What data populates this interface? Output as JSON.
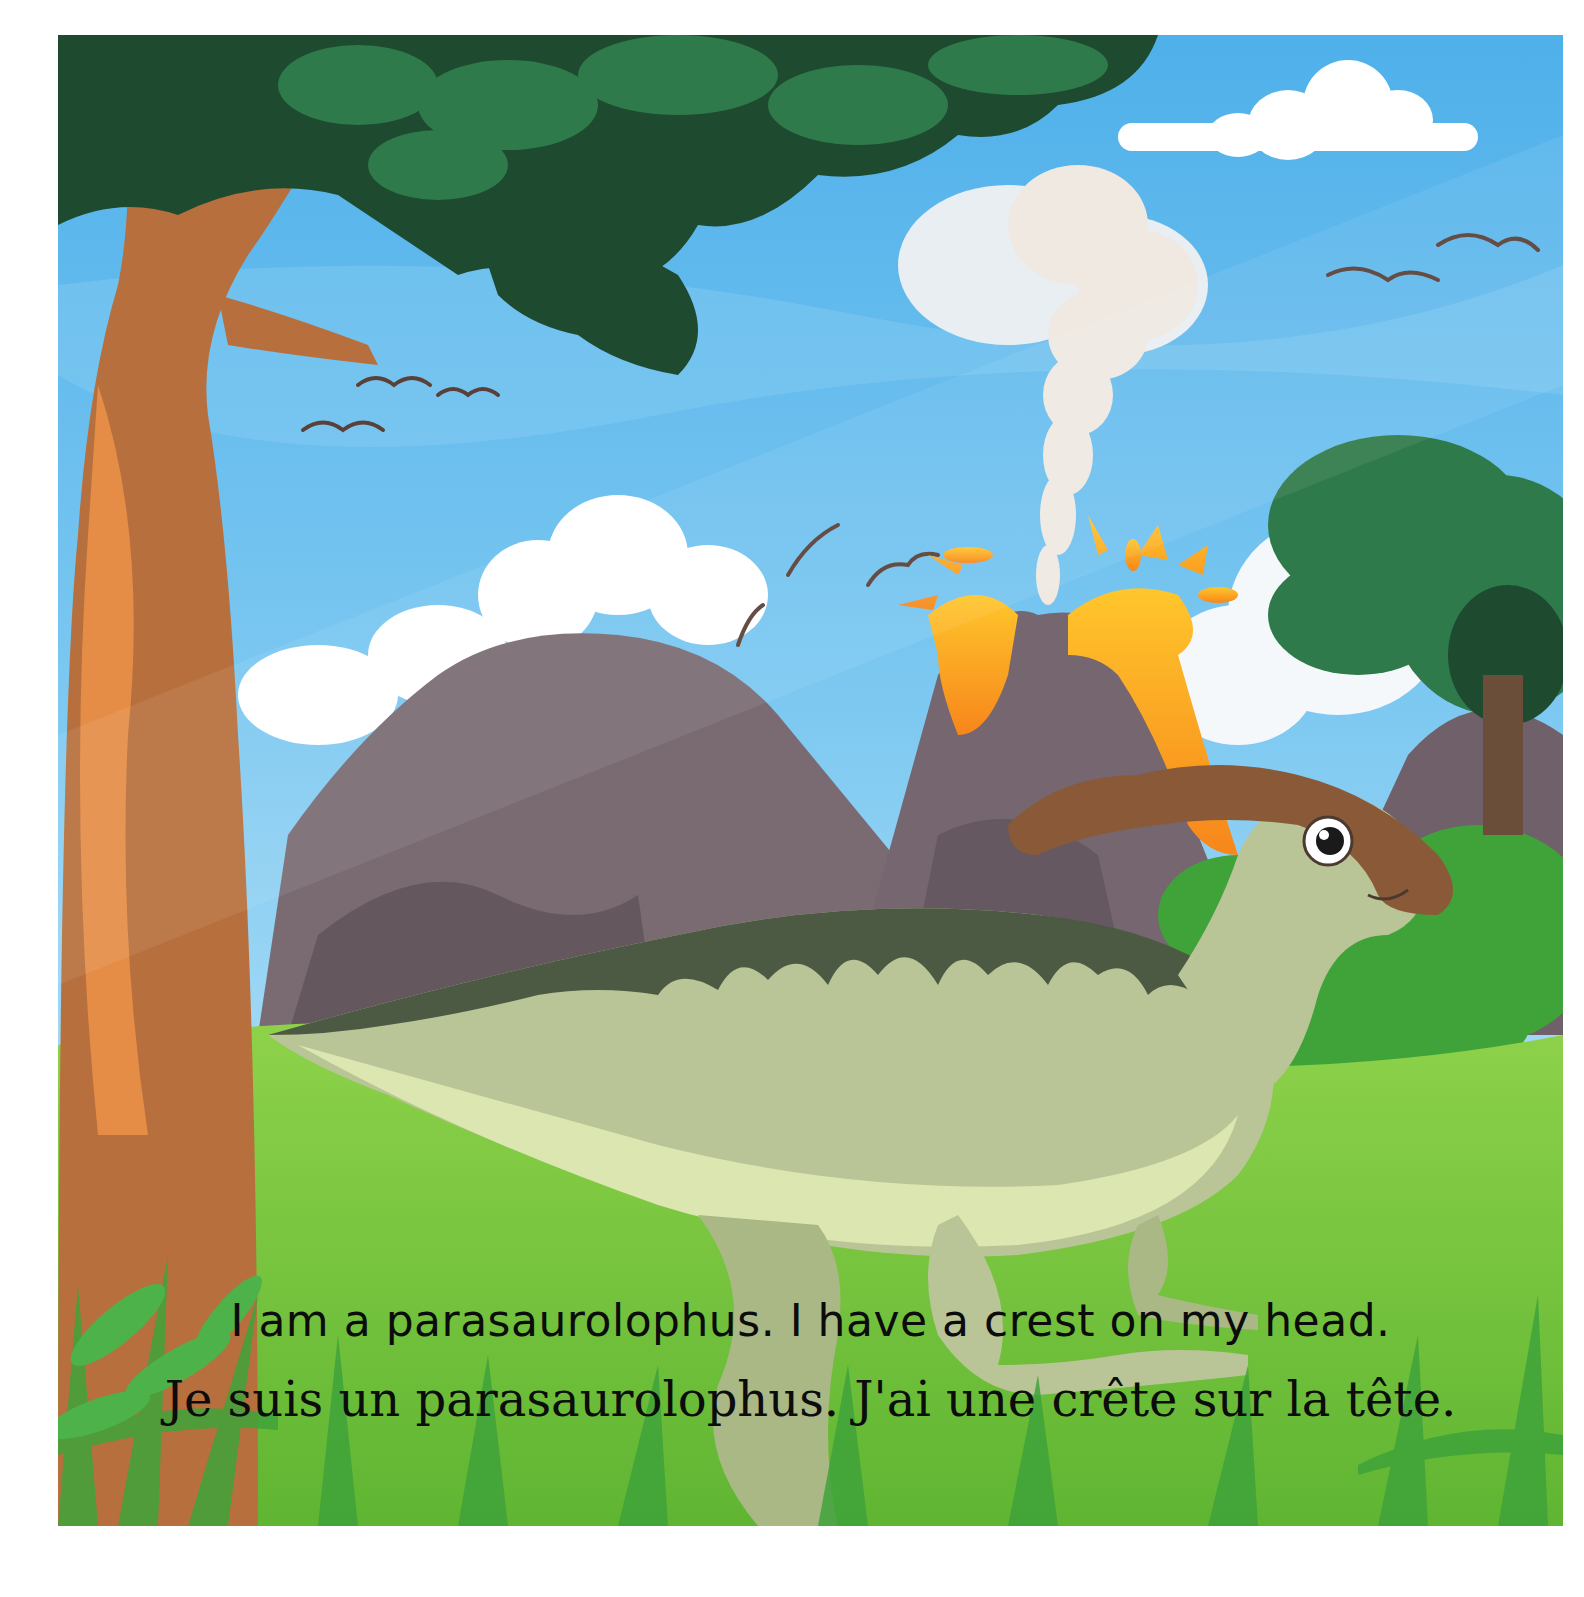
{
  "page": {
    "type": "picture-book-page",
    "caption_en": "I am a parasaurolophus. I have a crest on my head.",
    "caption_fr": "Je suis un parasaurolophus. J'ai une crête sur la tête."
  },
  "scene": {
    "elements": [
      "tree-trunk",
      "tree-canopy",
      "volcano",
      "lava",
      "smoke-plume",
      "mountains",
      "clouds",
      "birds",
      "bush-right",
      "grass-meadow",
      "grass-blades",
      "parasaurolophus"
    ],
    "colors": {
      "sky": "#5bb6ec",
      "sky_light": "#8fd0f3",
      "cloud": "#ffffff",
      "canopy_dark": "#1e4a30",
      "canopy_mid": "#2f7a4a",
      "trunk": "#b7703d",
      "trunk_light": "#f0954a",
      "mountain": "#7a6b73",
      "mountain_dark": "#5c4e56",
      "lava": "#f7a21b",
      "lava_light": "#ffd23a",
      "smoke": "#efe9e2",
      "grass": "#7cc83a",
      "grass_dark": "#3fa33a",
      "dino_body": "#b9c596",
      "dino_belly": "#dbe6b0",
      "dino_stripes": "#4c5a44",
      "dino_crest": "#8a5a38",
      "bird": "#5a4038"
    }
  }
}
